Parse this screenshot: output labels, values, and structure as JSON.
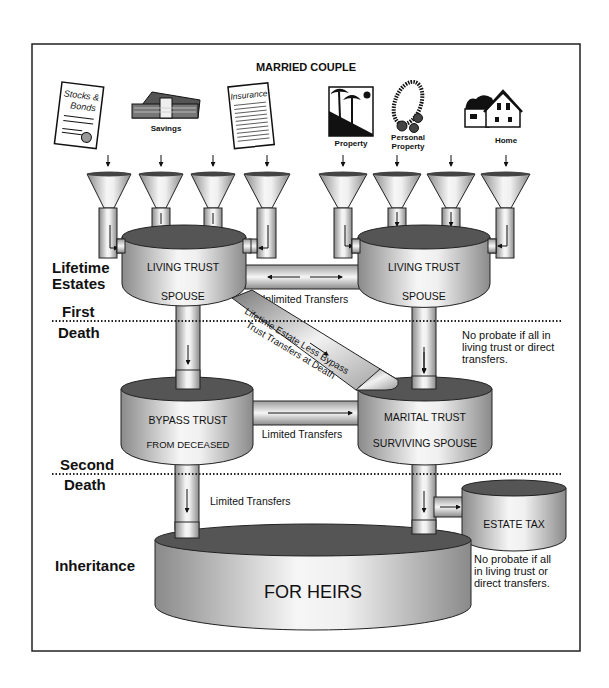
{
  "title": "MARRIED COUPLE",
  "assets": [
    {
      "icon": "stocks-bonds-certificate-icon",
      "label": "",
      "icon_text": [
        "Stocks &",
        "Bonds"
      ]
    },
    {
      "icon": "cash-stack-icon",
      "label": "Savings"
    },
    {
      "icon": "insurance-document-icon",
      "label": "",
      "icon_text": [
        "Insurance"
      ]
    },
    {
      "icon": "property-palm-trees-icon",
      "label": "Property"
    },
    {
      "icon": "jewelry-necklace-icon",
      "label": "Personal Property",
      "label_lines": [
        "Personal",
        "Property"
      ]
    },
    {
      "icon": "house-icon",
      "label": "Home"
    }
  ],
  "stages": {
    "lifetime": [
      "Lifetime",
      "Estates"
    ],
    "first_death": [
      "First",
      "Death"
    ],
    "second_death": [
      "Second",
      "Death"
    ],
    "inheritance": "Inheritance"
  },
  "tanks": {
    "living_trust_left": {
      "title": "LIVING TRUST",
      "subtitle": "SPOUSE"
    },
    "living_trust_right": {
      "title": "LIVING TRUST",
      "subtitle": "SPOUSE"
    },
    "bypass_trust": {
      "title": "BYPASS TRUST",
      "subtitle": "FROM DECEASED"
    },
    "marital_trust": {
      "title": "MARITAL TRUST",
      "subtitle": "SURVIVING SPOUSE"
    },
    "estate_tax": {
      "title": "ESTATE TAX"
    },
    "heirs": {
      "title": "FOR HEIRS"
    }
  },
  "flows": {
    "unlimited": "Unlimited Transfers",
    "diagonal": [
      "Lifetime Estate Less Bypass",
      "Trust Transfers at Death"
    ],
    "limited_mid": "Limited Transfers",
    "limited_bottom": "Limited Transfers"
  },
  "notes": {
    "upper": [
      "No probate if all in",
      "living trust or direct",
      "transfers."
    ],
    "lower": [
      "No probate if all",
      "in living trust or",
      "direct transfers."
    ]
  },
  "colors": {
    "ink": "#111111",
    "tank_top": "#555555",
    "metal_dark": "#8c8c8c",
    "metal_light": "#f4f4f4",
    "border": "#222222"
  }
}
